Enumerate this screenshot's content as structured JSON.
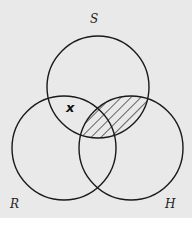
{
  "diagram": {
    "type": "venn-3",
    "sets": [
      {
        "id": "S",
        "label": "S",
        "cx": 98,
        "cy": 87,
        "r": 51
      },
      {
        "id": "R",
        "label": "R",
        "cx": 64,
        "cy": 148,
        "r": 52
      },
      {
        "id": "H",
        "label": "H",
        "cx": 131,
        "cy": 148,
        "r": 52
      }
    ],
    "labels": {
      "s": "S",
      "r": "R",
      "h": "H"
    },
    "marker": {
      "text": "x",
      "region": "S ∩ R (outside H)"
    },
    "shaded_region": "S ∩ H",
    "colors": {
      "stroke": "#1a1a1a",
      "background": "#e9e9e9",
      "hatch": "#1a1a1a"
    }
  }
}
